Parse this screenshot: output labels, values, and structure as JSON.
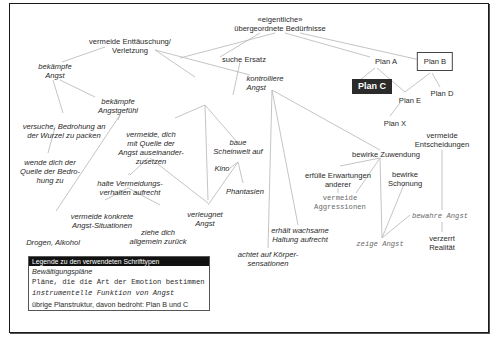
{
  "nodes": {
    "root": "«eigentliche»\nübergeordnete Bedürfnisse",
    "vermeide_enttaeuschung": "vermeide Enttäuschung/\nVerletzung",
    "suche_ersatz": "suche Ersatz",
    "plan_a": "Plan A",
    "plan_b": "Plan B",
    "plan_c": "Plan C",
    "plan_d": "Plan D",
    "plan_e": "Plan E",
    "plan_x": "Plan X",
    "bekaempfe_angst": "bekämpfe\nAngst",
    "bekaempfe_angstgefuehl": "bekämpfe\nAngstgefühl",
    "kontrolliere_angst": "kontrolliere\nAngst",
    "versuche_bedrohung": "versuche, Bedrohung an\nder Wurzel zu packen",
    "wende_dich": "wende dich der\nQuelle der Bedro-\nhung zu",
    "vermeide_dich": "vermeide, dich\nmit Quelle der\nAngst auseinander-\nzusetzen",
    "baue_scheinwelt": "baue\nScheinwelt auf",
    "kino": "Kino",
    "phantasien": "Phantasien",
    "halte_vermeidung": "halte Vermeidungs-\nverhalten aufrecht",
    "verleugnet_angst": "verleugnet\nAngst",
    "vermeide_konkrete": "vermeide konkrete\nAngst-Situationen",
    "ziehe_dich": "ziehe dich\nallgemein zurück",
    "drogen": "Drogen, Alkohol",
    "bewirke_zuwendung": "bewirke Zuwendung",
    "erfuelle": "erfülle Erwartungen\nanderer",
    "vermeide_aggr": "vermeide\nAggressionen",
    "bewirke_schonung": "bewirke\nSchonung",
    "vermeide_entsch": "vermeide\nEntscheidungen",
    "bewahre_angst": "bewahre Angst",
    "zeige_angst": "zeige Angst",
    "verzerrt": "verzerrt\nRealität",
    "erhaelt": "erhält wachsame\nHaltung aufrecht",
    "achtet": "achtet auf Körper-\nsensationen"
  },
  "legend": {
    "title": "Legende zu den verwendeten Schrifttypen",
    "rows": [
      "Bewältigungspläne",
      "Pläne, die die Art der Emotion bestimmen",
      "instrumentelle Funktion von Angst",
      "übrige Planstruktur, davon bedroht: Plan B und C"
    ]
  },
  "colors": {
    "line": "#bdbdbd",
    "plan_c_bg": "#2b2b2b",
    "text": "#2a2a2a",
    "mono": "#6a6a6a"
  }
}
